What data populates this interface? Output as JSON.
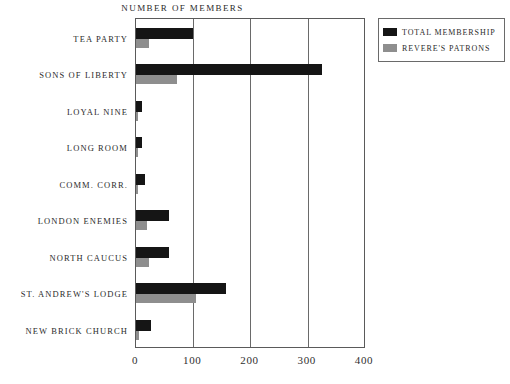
{
  "chart_data": {
    "type": "bar",
    "orientation": "horizontal",
    "title": "NUMBER OF MEMBERS",
    "xlabel": "",
    "ylabel": "",
    "xlim": [
      0,
      400
    ],
    "xticks": [
      0,
      100,
      200,
      300,
      400
    ],
    "xtick_labels": [
      "0",
      "100",
      "200",
      "300",
      "400"
    ],
    "grid": "vertical",
    "legend_position": "top-right",
    "categories": [
      "TEA PARTY",
      "SONS OF LIBERTY",
      "LOYAL NINE",
      "LONG ROOM",
      "COMM. CORR.",
      "LONDON ENEMIES",
      "NORTH CAUCUS",
      "ST. ANDREW'S LODGE",
      "NEW BRICK CHURCH"
    ],
    "series": [
      {
        "name": "TOTAL MEMBERSHIP",
        "color": "#151515",
        "values": [
          100,
          325,
          10,
          10,
          16,
          57,
          58,
          158,
          27
        ]
      },
      {
        "name": "REVERE'S PATRONS",
        "color": "#8e8e8e",
        "values": [
          23,
          72,
          4,
          3,
          3,
          19,
          22,
          105,
          6
        ]
      }
    ]
  },
  "legend": {
    "entries": [
      {
        "label": "TOTAL MEMBERSHIP",
        "swatch": "legend-swatch-black"
      },
      {
        "label": "REVERE'S PATRONS",
        "swatch": "legend-swatch-gray"
      }
    ]
  }
}
